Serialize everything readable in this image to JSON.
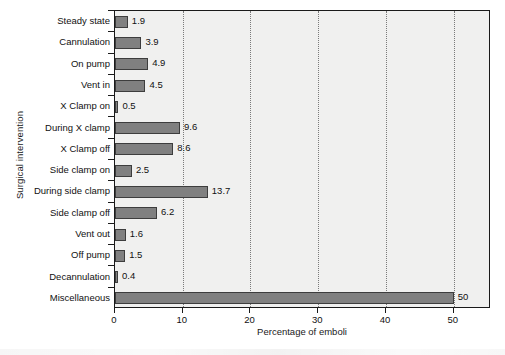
{
  "chart_data": {
    "type": "bar",
    "orientation": "horizontal",
    "title": "",
    "xlabel": "Percentage of emboli",
    "ylabel": "Surgical intervention",
    "xlim": [
      0,
      55.5
    ],
    "xticks": [
      0,
      10,
      20,
      30,
      40,
      50
    ],
    "xtick_labels": [
      "0",
      "10",
      "20",
      "30",
      "40",
      "50"
    ],
    "grid": "vertical-dotted",
    "legend": "none",
    "bar_color": "#808080",
    "bar_edge_color": "#3d3d3d",
    "plot_background": "#f0f0ef",
    "categories": [
      "Steady state",
      "Cannulation",
      "On pump",
      "Vent in",
      "X Clamp on",
      "During X clamp",
      "X Clamp off",
      "Side clamp on",
      "During side clamp",
      "Side clamp off",
      "Vent out",
      "Off pump",
      "Decannulation",
      "Miscellaneous"
    ],
    "values": [
      1.9,
      3.9,
      4.9,
      4.5,
      0.5,
      9.6,
      8.6,
      2.5,
      13.7,
      6.2,
      1.6,
      1.5,
      0.4,
      50
    ],
    "value_labels": [
      "1.9",
      "3.9",
      "4.9",
      "4.5",
      "0.5",
      "9.6",
      "8.6",
      "2.5",
      "13.7",
      "6.2",
      "1.6",
      "1.5",
      "0.4",
      "50"
    ]
  }
}
